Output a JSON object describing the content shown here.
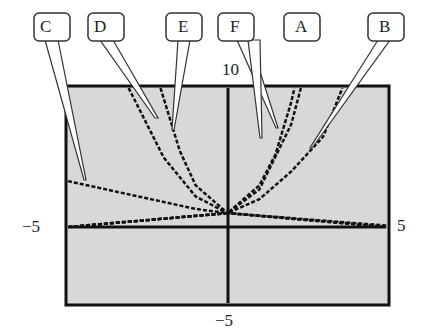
{
  "chart_data": {
    "type": "line",
    "title": "",
    "xlabel": "",
    "ylabel": "",
    "window": {
      "xmin": -5,
      "xmax": 5,
      "ymin": -5,
      "ymax": 10
    },
    "axis_labels": {
      "ymax": "10",
      "ymin": "−5",
      "xmin": "−5",
      "xmax": "5"
    },
    "grid": false,
    "background": "#d8d8d8",
    "series": [
      {
        "name": "A",
        "description": "steep exponential rising right",
        "points": [
          [
            -5,
            0.0
          ],
          [
            0,
            1
          ],
          [
            1,
            3
          ],
          [
            1.5,
            5.2
          ],
          [
            2,
            9
          ],
          [
            2.1,
            10
          ]
        ]
      },
      {
        "name": "B",
        "description": "gentler exponential rising right",
        "points": [
          [
            -5,
            0.0
          ],
          [
            0,
            1
          ],
          [
            1,
            2
          ],
          [
            2,
            4
          ],
          [
            3,
            6.5
          ],
          [
            3.6,
            10
          ]
        ]
      },
      {
        "name": "C",
        "description": "slow exponential rising left",
        "points": [
          [
            -5,
            3.3
          ],
          [
            -3,
            2.3
          ],
          [
            -1,
            1.3
          ],
          [
            0,
            1
          ],
          [
            5,
            0.1
          ]
        ]
      },
      {
        "name": "D",
        "description": "exponential rising left",
        "points": [
          [
            -3.1,
            10
          ],
          [
            -2,
            5
          ],
          [
            -1,
            2.2
          ],
          [
            0,
            1
          ],
          [
            5,
            0.0
          ]
        ]
      },
      {
        "name": "E",
        "description": "steep exponential rising left",
        "points": [
          [
            -2.1,
            10
          ],
          [
            -1.5,
            5.5
          ],
          [
            -1,
            3
          ],
          [
            0,
            1
          ],
          [
            5,
            0.0
          ]
        ]
      },
      {
        "name": "F",
        "description": "exponential rising right",
        "points": [
          [
            -5,
            0.0
          ],
          [
            0,
            1
          ],
          [
            1,
            2.7
          ],
          [
            2,
            7.4
          ],
          [
            2.3,
            10
          ]
        ]
      }
    ]
  },
  "callouts": [
    "C",
    "D",
    "E",
    "F",
    "A",
    "B"
  ]
}
